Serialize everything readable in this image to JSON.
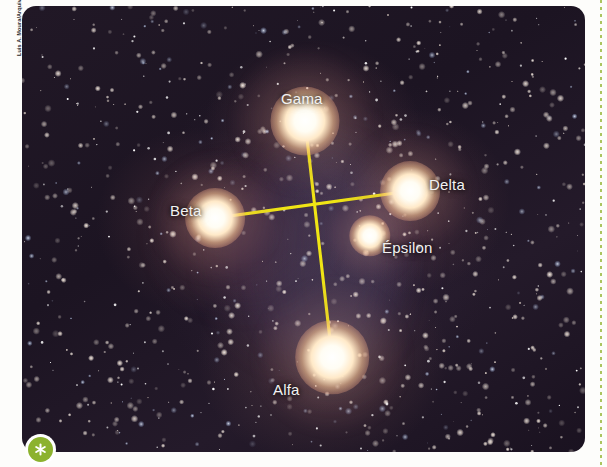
{
  "figure": {
    "kind": "astronomy-photograph",
    "credit": "Luis A. Moura/Arquivo da editora"
  },
  "badge": {
    "icon": "asterisk-icon",
    "glyph": "✳",
    "color": "#8cb22e"
  },
  "rule": {
    "color": "#9dbb45"
  },
  "stars": [
    {
      "id": "gama",
      "label": "Gama",
      "x": 283,
      "y": 115,
      "size": 30,
      "label_x": 259,
      "label_y": 84
    },
    {
      "id": "delta",
      "label": "Delta",
      "x": 388,
      "y": 185,
      "size": 26,
      "label_x": 407,
      "label_y": 170
    },
    {
      "id": "beta",
      "label": "Beta",
      "x": 193,
      "y": 212,
      "size": 26,
      "label_x": 148,
      "label_y": 196
    },
    {
      "id": "epsilon",
      "label": "Épsilon",
      "x": 348,
      "y": 230,
      "size": 18,
      "label_x": 360,
      "label_y": 233
    },
    {
      "id": "alfa",
      "label": "Alfa",
      "x": 310,
      "y": 351,
      "size": 32,
      "label_x": 251,
      "label_y": 375
    }
  ],
  "constellation_lines": [
    {
      "from": "gama",
      "to": "alfa",
      "x1": 283,
      "y1": 115,
      "x2": 310,
      "y2": 351
    },
    {
      "from": "beta",
      "to": "delta",
      "x1": 193,
      "y1": 212,
      "x2": 388,
      "y2": 185
    }
  ],
  "line_color": "#f0e515"
}
